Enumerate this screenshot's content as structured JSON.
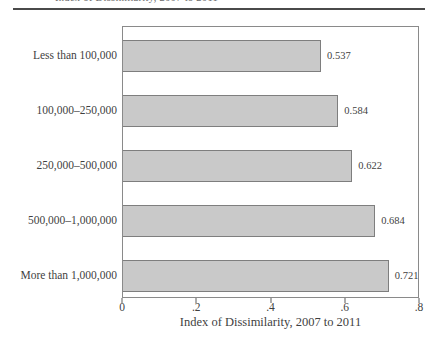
{
  "header": {
    "clipped_text_fragment": "Index of Dissimilarity, 2007 to 2011"
  },
  "colors": {
    "background": "#ffffff",
    "bar_fill": "#c9c9c9",
    "bar_border": "#7e7e7e",
    "frame_border": "#8a8a8a",
    "rule": "#4a4a4a",
    "text": "#3f3f3f"
  },
  "chart_data": {
    "type": "bar",
    "orientation": "horizontal",
    "title": "",
    "categories": [
      "Less than 100,000",
      "100,000–250,000",
      "250,000–500,000",
      "500,000–1,000,000",
      "More than 1,000,000"
    ],
    "values": [
      0.537,
      0.584,
      0.622,
      0.684,
      0.721
    ],
    "value_labels": [
      "0.537",
      "0.584",
      "0.622",
      "0.684",
      "0.721"
    ],
    "xlabel": "Index of Dissimilarity, 2007 to 2011",
    "ylabel": "",
    "xlim": [
      0,
      0.8
    ],
    "xticks": [
      {
        "value": 0,
        "label": "0"
      },
      {
        "value": 0.2,
        "label": ".2"
      },
      {
        "value": 0.4,
        "label": ".4"
      },
      {
        "value": 0.6,
        "label": ".6"
      },
      {
        "value": 0.8,
        "label": ".8"
      }
    ],
    "grid": false,
    "legend": false
  }
}
